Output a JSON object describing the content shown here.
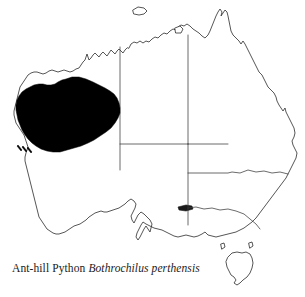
{
  "figure": {
    "kind": "species-distribution-map",
    "region": "Australia",
    "background_color": "#ffffff",
    "outline_color": "#2b2b2b",
    "border_color": "#3a3a3a",
    "range_color": "#000000"
  },
  "caption": {
    "common_name": "Ant-hill Python",
    "scientific_name": "Bothrochilus perthensis",
    "full_text": "Ant-hill Python Bothrochilus perthensis"
  },
  "map": {
    "title": "Australia",
    "landmass_name": "mainland-australia",
    "islands": [
      {
        "name": "tasmania"
      },
      {
        "name": "melville-island"
      },
      {
        "name": "kangaroo-island"
      },
      {
        "name": "groote-eylandt"
      },
      {
        "name": "king-island"
      },
      {
        "name": "flinders-island"
      }
    ],
    "state_borders": [
      {
        "name": "wa-nt-sa-border-vertical"
      },
      {
        "name": "nt-qld-border-vertical"
      },
      {
        "name": "wa-sa-border-horizontal"
      },
      {
        "name": "nt-sa-border-horizontal"
      },
      {
        "name": "qld-nsw-border"
      },
      {
        "name": "sa-nsw-vic-border"
      },
      {
        "name": "nsw-vic-border"
      }
    ],
    "range_overlay": {
      "name": "ant-hill-python-range",
      "description": "Pilbara region, northwestern Western Australia",
      "fill": "#000000"
    }
  }
}
